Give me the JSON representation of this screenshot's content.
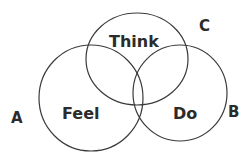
{
  "diagram": {
    "type": "venn",
    "sets": [
      {
        "id": "feel",
        "label": "Feel",
        "corner_label": "A",
        "cx": 91,
        "cy": 98,
        "rx": 52,
        "ry": 53
      },
      {
        "id": "do",
        "label": "Do",
        "corner_label": "B",
        "cx": 180,
        "cy": 93,
        "rx": 47,
        "ry": 48
      },
      {
        "id": "think",
        "label": "Think",
        "corner_label": "C",
        "cx": 137,
        "cy": 59,
        "rx": 51,
        "ry": 46
      }
    ],
    "labels": {
      "feel": "Feel",
      "do": "Do",
      "think": "Think",
      "a": "A",
      "b": "B",
      "c": "C"
    },
    "stroke_color": "#3a3a3a",
    "text_color": "#2b2b2b",
    "background": "#ffffff"
  }
}
